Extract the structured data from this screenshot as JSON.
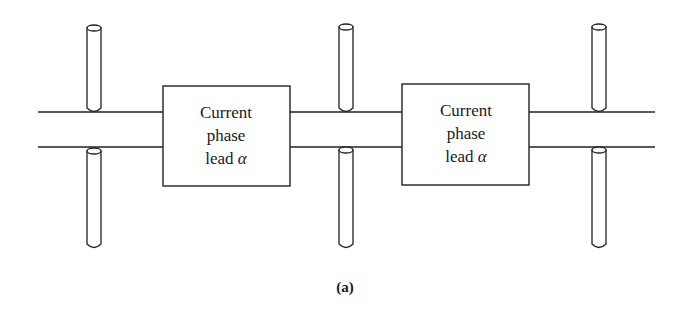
{
  "figure": {
    "caption": "(a)",
    "blocks": [
      {
        "line1": "Current",
        "line2": "phase",
        "line3_prefix": "lead ",
        "line3_symbol": "α"
      },
      {
        "line1": "Current",
        "line2": "phase",
        "line3_prefix": "lead ",
        "line3_symbol": "α"
      }
    ],
    "dipole_count": 3,
    "colors": {
      "stroke": "#222222",
      "background": "#ffffff"
    }
  }
}
